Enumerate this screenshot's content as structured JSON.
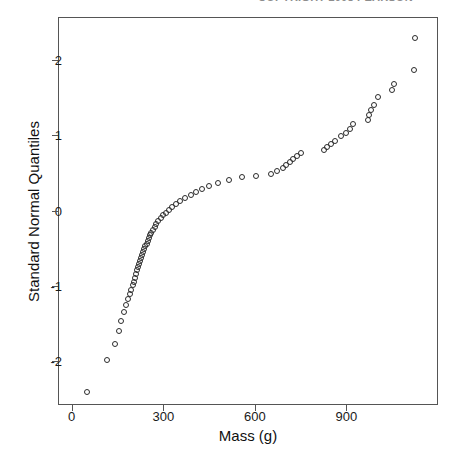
{
  "caption": {
    "clipped_header_text": "COPYRIGHT 2008 PEARSON"
  },
  "axes": {
    "x_title": "Mass (g)",
    "y_title": "Standard Normal Quantiles",
    "x_ticks": [
      "0",
      "300",
      "600",
      "900"
    ],
    "y_ticks": [
      "2",
      "1",
      "0",
      "-1",
      "-2"
    ]
  },
  "chart_data": {
    "type": "scatter",
    "title": "",
    "subtitle": "",
    "xlabel": "Mass (g)",
    "ylabel": "Standard Normal Quantiles",
    "xlim": [
      -45,
      1200
    ],
    "ylim": [
      -2.58,
      2.57
    ],
    "grid": false,
    "legend": "none",
    "marker": "open-circle",
    "marker_color": "#2b2b2b",
    "annotations": [],
    "x": [
      46,
      112,
      140,
      150,
      160,
      165,
      172,
      178,
      182,
      186,
      190,
      194,
      198,
      200,
      204,
      207,
      210,
      213,
      216,
      219,
      222,
      225,
      228,
      231,
      234,
      236,
      238,
      241,
      244,
      247,
      250,
      253,
      256,
      259,
      262,
      266,
      270,
      274,
      278,
      283,
      288,
      295,
      302,
      312,
      322,
      334,
      348,
      360,
      372,
      392,
      412,
      432,
      455,
      478,
      496,
      515,
      545,
      560,
      575,
      600,
      620,
      640,
      660,
      682,
      700,
      717,
      730,
      745,
      762,
      790,
      810,
      835,
      855,
      872,
      890,
      905,
      920,
      940,
      960,
      985,
      1010,
      1030,
      1045,
      1060,
      1095,
      1120
    ],
    "y": [
      -2.4,
      -1.97,
      -1.76,
      -1.58,
      -1.45,
      -1.37,
      -1.28,
      -1.21,
      -1.15,
      -1.09,
      -1.04,
      -0.99,
      -0.95,
      -0.91,
      -0.87,
      -0.83,
      -0.79,
      -0.76,
      -0.72,
      -0.69,
      -0.66,
      -0.63,
      -0.6,
      -0.57,
      -0.54,
      -0.51,
      -0.49,
      -0.46,
      -0.43,
      -0.41,
      -0.38,
      -0.36,
      -0.33,
      -0.31,
      -0.28,
      -0.26,
      -0.23,
      -0.21,
      -0.19,
      -0.16,
      -0.14,
      -0.12,
      -0.09,
      -0.07,
      -0.05,
      -0.02,
      0.0,
      0.02,
      0.05,
      0.07,
      0.09,
      0.12,
      0.14,
      0.16,
      0.19,
      0.21,
      0.23,
      0.26,
      0.28,
      0.31,
      0.33,
      0.36,
      0.38,
      0.41,
      0.43,
      0.46,
      0.49,
      0.51,
      0.54,
      0.57,
      0.6,
      0.63,
      0.66,
      0.69,
      0.72,
      0.76,
      0.79,
      0.83,
      0.87,
      0.91,
      0.95,
      0.99,
      1.04,
      1.09,
      1.15,
      1.21
    ],
    "points": [
      [
        46,
        -2.4
      ],
      [
        112,
        -1.97
      ],
      [
        140,
        -1.76
      ],
      [
        152,
        -1.58
      ],
      [
        158,
        -1.45
      ],
      [
        168,
        -1.33
      ],
      [
        175,
        -1.24
      ],
      [
        180,
        -1.16
      ],
      [
        186,
        -1.1
      ],
      [
        190,
        -1.04
      ],
      [
        196,
        -0.98
      ],
      [
        200,
        -0.93
      ],
      [
        204,
        -0.88
      ],
      [
        208,
        -0.83
      ],
      [
        212,
        -0.78
      ],
      [
        214,
        -0.74
      ],
      [
        218,
        -0.7
      ],
      [
        221,
        -0.66
      ],
      [
        224,
        -0.62
      ],
      [
        227,
        -0.58
      ],
      [
        230,
        -0.54
      ],
      [
        234,
        -0.5
      ],
      [
        238,
        -0.46
      ],
      [
        242,
        -0.43
      ],
      [
        246,
        -0.39
      ],
      [
        250,
        -0.35
      ],
      [
        254,
        -0.31
      ],
      [
        258,
        -0.28
      ],
      [
        262,
        -0.24
      ],
      [
        268,
        -0.2
      ],
      [
        274,
        -0.17
      ],
      [
        280,
        -0.13
      ],
      [
        288,
        -0.09
      ],
      [
        296,
        -0.05
      ],
      [
        304,
        -0.02
      ],
      [
        314,
        0.02
      ],
      [
        326,
        0.06
      ],
      [
        338,
        0.1
      ],
      [
        352,
        0.14
      ],
      [
        368,
        0.18
      ],
      [
        386,
        0.22
      ],
      [
        404,
        0.26
      ],
      [
        424,
        0.3
      ],
      [
        448,
        0.34
      ],
      [
        476,
        0.38
      ],
      [
        512,
        0.42
      ],
      [
        556,
        0.46
      ],
      [
        600,
        0.47
      ],
      [
        648,
        0.5
      ],
      [
        668,
        0.54
      ],
      [
        690,
        0.58
      ],
      [
        700,
        0.62
      ],
      [
        712,
        0.66
      ],
      [
        722,
        0.7
      ],
      [
        735,
        0.74
      ],
      [
        748,
        0.78
      ],
      [
        822,
        0.82
      ],
      [
        832,
        0.86
      ],
      [
        845,
        0.9
      ],
      [
        860,
        0.94
      ],
      [
        880,
        1.0
      ],
      [
        896,
        1.04
      ],
      [
        908,
        1.1
      ],
      [
        918,
        1.16
      ],
      [
        968,
        1.22
      ],
      [
        972,
        1.28
      ],
      [
        978,
        1.35
      ],
      [
        986,
        1.42
      ],
      [
        1000,
        1.52
      ],
      [
        1046,
        1.62
      ],
      [
        1052,
        1.7
      ],
      [
        1118,
        1.88
      ],
      [
        1120,
        2.3
      ]
    ]
  }
}
